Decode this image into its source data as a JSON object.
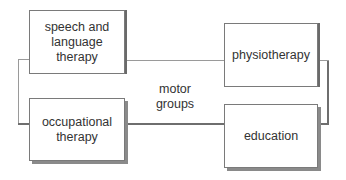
{
  "diagram": {
    "nodes": [
      {
        "id": "speech",
        "label": "speech and language therapy",
        "lines": [
          "speech and",
          "language",
          "therapy"
        ]
      },
      {
        "id": "physio",
        "label": "physiotherapy",
        "lines": [
          "physiotherapy"
        ]
      },
      {
        "id": "occupational",
        "label": "occupational therapy",
        "lines": [
          "occupational",
          "therapy"
        ]
      },
      {
        "id": "education",
        "label": "education",
        "lines": [
          "education"
        ]
      }
    ],
    "center": {
      "label": "motor groups",
      "lines": [
        "motor",
        "groups"
      ]
    },
    "edges": [
      {
        "from": "speech",
        "to": "physio"
      },
      {
        "from": "physio",
        "to": "education"
      },
      {
        "from": "education",
        "to": "occupational"
      },
      {
        "from": "occupational",
        "to": "speech"
      }
    ]
  }
}
